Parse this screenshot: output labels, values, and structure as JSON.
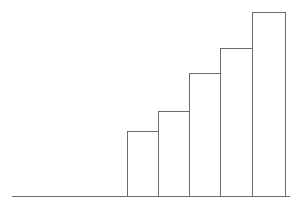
{
  "chart_data": {
    "type": "bar",
    "title": "",
    "subtitle": "",
    "xlabel": "",
    "ylabel": "",
    "categories": [
      "1",
      "2",
      "3",
      "4",
      "5"
    ],
    "values": [
      65,
      85,
      123,
      148,
      184
    ],
    "series": [
      {
        "name": "",
        "values": [
          65,
          85,
          123,
          148,
          184
        ]
      }
    ],
    "xlim": [
      0,
      5
    ],
    "ylim": [
      0,
      196
    ],
    "grid": false,
    "legend": false,
    "legend_position": "none",
    "tick_labels_x": [],
    "tick_labels_y": [],
    "annotations": [],
    "bars": [
      {
        "label": "1",
        "value": 65,
        "x": 127,
        "width": 31,
        "top": 131
      },
      {
        "label": "2",
        "value": 85,
        "x": 158,
        "width": 32,
        "top": 111
      },
      {
        "label": "3",
        "value": 123,
        "x": 189,
        "width": 32,
        "top": 73
      },
      {
        "label": "4",
        "value": 148,
        "x": 220,
        "width": 32,
        "top": 48
      },
      {
        "label": "5",
        "value": 184,
        "x": 252,
        "width": 33,
        "top": 12
      }
    ],
    "baseline": {
      "y": 196,
      "x_start": 12,
      "x_end": 290
    }
  },
  "style": {
    "background_color": "#ffffff",
    "stroke_color": "#6b6b6b",
    "bar_fill_color": "#ffffff",
    "baseline_color": "#6b6b6b"
  },
  "canvas": {
    "width": 298,
    "height": 211
  }
}
